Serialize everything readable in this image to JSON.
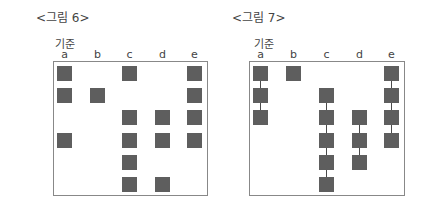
{
  "figures": [
    {
      "title": "<그림 6>",
      "column_header": "기준",
      "row_header": "단위",
      "columns": [
        "a",
        "b",
        "c",
        "d",
        "e"
      ],
      "rows": [
        "2",
        "1",
        "4",
        "3",
        "6",
        "5"
      ],
      "first_row_label": "단위 2",
      "connected": false,
      "cells": [
        {
          "row": 0,
          "col": 0
        },
        {
          "row": 0,
          "col": 2
        },
        {
          "row": 0,
          "col": 4
        },
        {
          "row": 1,
          "col": 0
        },
        {
          "row": 1,
          "col": 1
        },
        {
          "row": 1,
          "col": 4
        },
        {
          "row": 2,
          "col": 2
        },
        {
          "row": 2,
          "col": 3
        },
        {
          "row": 2,
          "col": 4
        },
        {
          "row": 3,
          "col": 0
        },
        {
          "row": 3,
          "col": 2
        },
        {
          "row": 3,
          "col": 3
        },
        {
          "row": 3,
          "col": 4
        },
        {
          "row": 4,
          "col": 2
        },
        {
          "row": 5,
          "col": 2
        },
        {
          "row": 5,
          "col": 3
        }
      ]
    },
    {
      "title": "<그림 7>",
      "column_header": "기준",
      "row_header": "단위",
      "columns": [
        "a",
        "b",
        "c",
        "d",
        "e"
      ],
      "rows": [
        "1",
        "2",
        "3",
        "4",
        "5",
        "6"
      ],
      "first_row_label": "단위 1",
      "connected": true,
      "cells": [
        {
          "row": 0,
          "col": 0
        },
        {
          "row": 0,
          "col": 1
        },
        {
          "row": 0,
          "col": 4
        },
        {
          "row": 1,
          "col": 0
        },
        {
          "row": 1,
          "col": 2
        },
        {
          "row": 1,
          "col": 4
        },
        {
          "row": 2,
          "col": 0
        },
        {
          "row": 2,
          "col": 2
        },
        {
          "row": 2,
          "col": 3
        },
        {
          "row": 2,
          "col": 4
        },
        {
          "row": 3,
          "col": 2
        },
        {
          "row": 3,
          "col": 3
        },
        {
          "row": 3,
          "col": 4
        },
        {
          "row": 4,
          "col": 2
        },
        {
          "row": 4,
          "col": 3
        },
        {
          "row": 5,
          "col": 2
        }
      ],
      "connectors": [
        {
          "col": 0,
          "from_row": 0,
          "to_row": 2
        },
        {
          "col": 2,
          "from_row": 1,
          "to_row": 5
        },
        {
          "col": 3,
          "from_row": 2,
          "to_row": 4
        },
        {
          "col": 4,
          "from_row": 0,
          "to_row": 3
        }
      ]
    }
  ],
  "colors": {
    "cell": "#5e5e5e",
    "frame": "#888888",
    "connector": "#4a4a4a"
  }
}
